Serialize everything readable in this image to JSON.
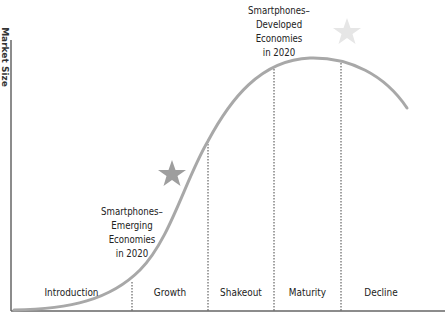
{
  "diagram": {
    "type": "product-life-cycle",
    "y_axis_label": "Market Size",
    "stages": [
      {
        "label": "Introduction"
      },
      {
        "label": "Growth"
      },
      {
        "label": "Shakeout"
      },
      {
        "label": "Maturity"
      },
      {
        "label": "Decline"
      }
    ],
    "annotations": {
      "developed": {
        "lines": [
          "Smartphones–",
          "Developed",
          "Economies",
          "in 2020"
        ]
      },
      "emerging": {
        "lines": [
          "Smartphones–",
          "Emerging",
          "Economies",
          "in 2020"
        ]
      }
    },
    "colors": {
      "curve": "#a8a8a8",
      "star_emerging": "#9e9e9e",
      "star_developed": "#e6e6e6",
      "axis": "#555555",
      "divider": "#444444"
    }
  }
}
